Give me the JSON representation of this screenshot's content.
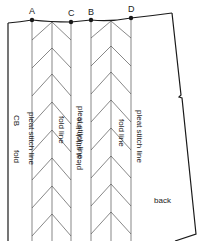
{
  "diagram": {
    "type": "pattern-piece",
    "piece_label": "back",
    "points": [
      {
        "id": "A",
        "label": "A"
      },
      {
        "id": "C",
        "label": "C"
      },
      {
        "id": "B",
        "label": "B"
      },
      {
        "id": "D",
        "label": "D"
      }
    ],
    "labels": {
      "cb": "CB",
      "fold": "fold",
      "pleat_stitch_line_1": "pleat stitch line",
      "fold_line_1": "fold line",
      "pleat_stitch_line_2": "pleat stitch line",
      "pleat_stitch_line_3": "pleat stitch line",
      "fold_line_2": "fold line",
      "pleat_stitch_line_4": "pleat stitch line",
      "back": "back"
    },
    "colors": {
      "line": "#1a1a1a",
      "background": "#ffffff"
    }
  }
}
